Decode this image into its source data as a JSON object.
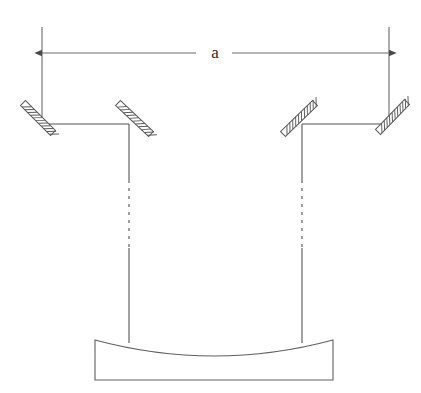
{
  "figure": {
    "kind": "optical-schematic",
    "title_label": "",
    "background_color": "#ffffff",
    "line_color": "#555555",
    "hatch_color": "#5a5a5a",
    "text_color": "#2b2b2b"
  },
  "dimension": {
    "label": "a",
    "label_x": 215,
    "label_y": 58,
    "arrow_y": 53,
    "left_x": 42,
    "right_x": 389,
    "gap_left_x": 196,
    "gap_right_x": 232,
    "extension_lines": [
      {
        "name": "left-extension-line",
        "x": 42,
        "y1": 27,
        "y2": 125
      },
      {
        "name": "right-extension-line",
        "x": 389,
        "y1": 27,
        "y2": 125
      }
    ]
  },
  "mirrors": [
    {
      "name": "outer-left-mirror",
      "x1": 23,
      "y1": 103,
      "x2": 53,
      "y2": 133,
      "width": 7,
      "hatch_count": 11
    },
    {
      "name": "inner-left-mirror",
      "x1": 118,
      "y1": 103,
      "x2": 151,
      "y2": 134,
      "width": 7,
      "hatch_count": 11
    },
    {
      "name": "inner-right-mirror",
      "x1": 283,
      "y1": 134,
      "x2": 315,
      "y2": 103,
      "width": 7,
      "hatch_count": 11
    },
    {
      "name": "outer-right-mirror",
      "x1": 378,
      "y1": 132,
      "x2": 407,
      "y2": 102,
      "width": 7,
      "hatch_count": 11
    }
  ],
  "beam_paths": {
    "horizontal_segments": [
      {
        "name": "left-horizontal-beam",
        "x1": 42,
        "x2": 129,
        "y": 124
      },
      {
        "name": "right-horizontal-beam",
        "x1": 302,
        "x2": 389,
        "y": 124
      }
    ],
    "vertical_segments": [
      {
        "name": "left-vertical-beam-upper",
        "x": 129,
        "y1": 124,
        "y2": 180,
        "style": "solid"
      },
      {
        "name": "left-vertical-beam-middle",
        "x": 129,
        "y1": 180,
        "y2": 248,
        "style": "dashed"
      },
      {
        "name": "left-vertical-beam-lower",
        "x": 129,
        "y1": 248,
        "y2": 343,
        "style": "solid"
      },
      {
        "name": "right-vertical-beam-upper",
        "x": 302,
        "y1": 124,
        "y2": 180,
        "style": "solid"
      },
      {
        "name": "right-vertical-beam-middle",
        "x": 302,
        "y1": 180,
        "y2": 248,
        "style": "dashed"
      },
      {
        "name": "right-vertical-beam-lower",
        "x": 302,
        "y1": 248,
        "y2": 343,
        "style": "solid"
      }
    ],
    "dash_pattern": "3,5"
  },
  "primary_mirror_block": {
    "name": "concave-primary-mirror",
    "left_x": 95,
    "right_x": 333,
    "top_y": 340,
    "bottom_y": 380,
    "curve_control_y": 372,
    "curve_lowest_y": 356,
    "center_x": 214
  }
}
